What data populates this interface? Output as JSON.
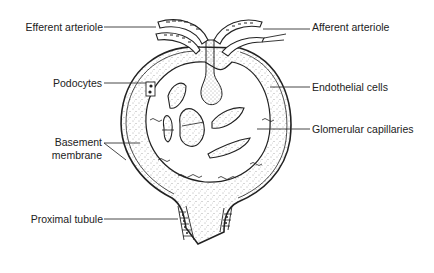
{
  "diagram": {
    "style": "black line drawing with stippled shading",
    "colors": {
      "ink": "#222222",
      "stipple": "#555555",
      "background": "#ffffff"
    }
  },
  "labels": {
    "efferent_arteriole": "Efferent arteriole",
    "afferent_arteriole": "Afferent arteriole",
    "podocytes": "Podocytes",
    "endothelial_cells": "Endothelial cells",
    "glomerular_capillaries": "Glomerular capillaries",
    "basement_membrane_line1": "Basement",
    "basement_membrane_line2": "membrane",
    "proximal_tubule": "Proximal tubule"
  }
}
